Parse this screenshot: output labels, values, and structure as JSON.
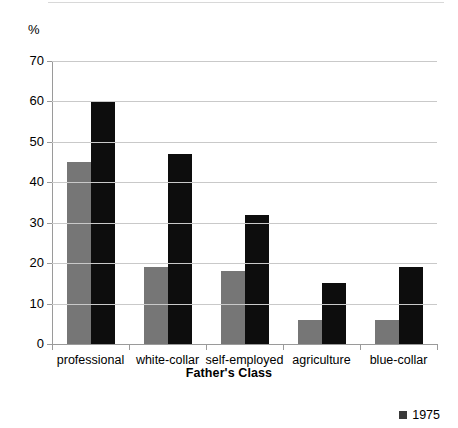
{
  "chart_data": {
    "type": "bar",
    "title": "",
    "subtitle": "",
    "xlabel": "Father's Class",
    "ylabel": "%",
    "y_unit_label": "%",
    "categories": [
      "professional",
      "white-collar",
      "self-employed",
      "agriculture",
      "blue-collar"
    ],
    "series": [
      {
        "name": "",
        "color": "#767676",
        "values": [
          45,
          19,
          18,
          6,
          6
        ]
      },
      {
        "name": "1975",
        "color": "#0d0d0d",
        "values": [
          60,
          47,
          32,
          15,
          19
        ]
      }
    ],
    "ylim": [
      0,
      70
    ],
    "ytick_labels": [
      "0",
      "10",
      "20",
      "30",
      "40",
      "50",
      "60",
      "70"
    ],
    "ytick_values": [
      0,
      10,
      20,
      30,
      40,
      50,
      60,
      70
    ],
    "grid": true,
    "legend_position": "bottom-right",
    "legend": [
      {
        "label": "1975",
        "color": "#3a3a3a",
        "marker": "square"
      }
    ]
  }
}
